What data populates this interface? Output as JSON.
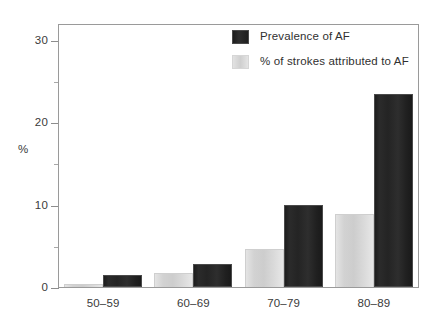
{
  "chart_data": {
    "type": "bar",
    "title": "",
    "xlabel": "",
    "ylabel": "%",
    "ylim": [
      0,
      32
    ],
    "grid": false,
    "legend_position": "top-right",
    "categories": [
      "50–59",
      "60–69",
      "70–79",
      "80–89"
    ],
    "y_ticks_major": [
      0,
      10,
      20,
      30
    ],
    "y_tick_labels": [
      "0",
      "10",
      "20",
      "30"
    ],
    "y_ticks_minor": [
      5,
      15,
      25
    ],
    "series": [
      {
        "name": "Prevalence of AF",
        "color": "#242424",
        "values": [
          1.5,
          2.8,
          9.9,
          23.4
        ]
      },
      {
        "name": "% of strokes attributed to AF",
        "color": "#d6d6d6",
        "values": [
          0.4,
          1.7,
          4.6,
          8.8
        ]
      }
    ]
  },
  "legend": {
    "items": [
      {
        "label": "Prevalence of AF",
        "swatch": "dark-swatch-icon"
      },
      {
        "label": "% of strokes attributed to AF",
        "swatch": "light-swatch-icon"
      }
    ]
  },
  "axis": {
    "y_title": "%"
  }
}
